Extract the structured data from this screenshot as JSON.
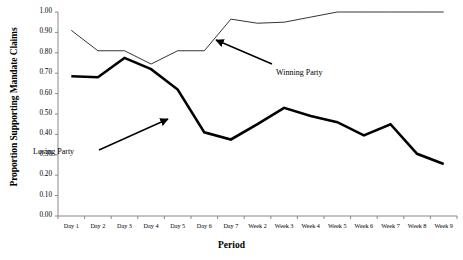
{
  "chart_data": {
    "type": "line",
    "title": "",
    "xlabel": "Period",
    "ylabel": "Proportion Supporting Mandate Claims",
    "categories": [
      "Day 1",
      "Day 2",
      "Day 3",
      "Day 4",
      "Day 5",
      "Day 6",
      "Day 7",
      "Week 2",
      "Week 3",
      "Week 4",
      "Week 5",
      "Week 6",
      "Week 7",
      "Week 8",
      "Week 9"
    ],
    "ylim": [
      0.0,
      1.0
    ],
    "ytick_labels": [
      "1.00",
      "0.90",
      "0.80",
      "0.70",
      "0.60",
      "0.50",
      "0.40",
      "0.30",
      "0.20",
      "0.10",
      "0.00"
    ],
    "ytick_values": [
      1.0,
      0.9,
      0.8,
      0.7,
      0.6,
      0.5,
      0.4,
      0.3,
      0.2,
      0.1,
      0.0
    ],
    "grid": false,
    "legend": "annotations",
    "series": [
      {
        "name": "Winning Party",
        "style": "thin",
        "values": [
          0.91,
          0.81,
          0.81,
          0.745,
          0.81,
          0.81,
          0.965,
          0.945,
          0.95,
          0.975,
          1.0,
          1.0,
          1.0,
          1.0,
          1.0
        ]
      },
      {
        "name": "Losing Party",
        "style": "thick",
        "values": [
          0.685,
          0.68,
          0.775,
          0.72,
          0.62,
          0.41,
          0.375,
          0.45,
          0.53,
          0.49,
          0.46,
          0.395,
          0.45,
          0.305,
          0.255
        ]
      }
    ],
    "annotations": [
      {
        "text": "Winning Party",
        "x": 276,
        "y": 68
      },
      {
        "text": "Losing Party",
        "x": 33,
        "y": 147
      }
    ]
  }
}
